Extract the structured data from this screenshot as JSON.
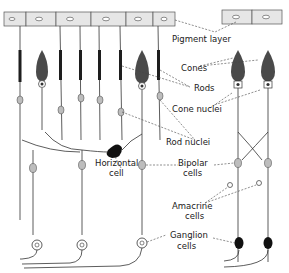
{
  "diagram": {
    "type": "retina-cell-layers",
    "labels": {
      "pigment_layer": "Pigment layer",
      "cones": "Cones",
      "rods": "Rods",
      "cone_nuclei": "Cone nuclei",
      "rod_nuclei": "Rod nuclei",
      "horizontal_cell_1": "Horizontal",
      "horizontal_cell_2": "cell",
      "bipolar_cells_1": "Bipolar",
      "bipolar_cells_2": "cells",
      "amacrine_cells_1": "Amacrine",
      "amacrine_cells_2": "cells",
      "ganglion_cells_1": "Ganglion",
      "ganglion_cells_2": "cells"
    },
    "colors": {
      "ink": "#1e1e1e",
      "pigment_fill": "#e6e6e6",
      "cone_fill": "#4a4a4a",
      "nucleus_fill": "#bdbdbd",
      "background": "#ffffff"
    }
  }
}
